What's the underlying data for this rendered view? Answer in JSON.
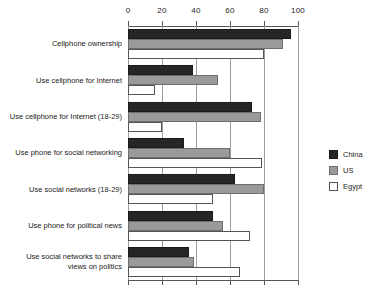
{
  "chart_data": {
    "type": "bar",
    "orientation": "horizontal",
    "title": "",
    "xlabel": "",
    "ylabel": "",
    "xlim": [
      0,
      100
    ],
    "xticks": [
      0,
      20,
      40,
      60,
      80,
      100
    ],
    "xtick_labels": [
      "0",
      "20",
      "40",
      "60",
      "80",
      "100"
    ],
    "grid": true,
    "legend_position": "right",
    "categories": [
      "Cellphone ownership",
      "Use cellphone for Internet",
      "Use cellphone for Internet (18-29)",
      "Use phone for social networking",
      "Use social networks (18-29)",
      "Use phone for political news",
      "Use social networks to share\nviews on politics"
    ],
    "series": [
      {
        "name": "China",
        "color": "#262626",
        "values": [
          96,
          38,
          73,
          33,
          63,
          50,
          36
        ]
      },
      {
        "name": "US",
        "color": "#9a9a9a",
        "values": [
          91,
          53,
          78,
          60,
          80,
          56,
          39
        ]
      },
      {
        "name": "Egypt",
        "color": "#ffffff",
        "values": [
          80,
          16,
          20,
          79,
          50,
          72,
          66
        ]
      }
    ]
  },
  "legend": {
    "entries": [
      {
        "label": "China",
        "swatch": "china"
      },
      {
        "label": "US",
        "swatch": "us"
      },
      {
        "label": "Egypt",
        "swatch": "egypt"
      }
    ]
  }
}
